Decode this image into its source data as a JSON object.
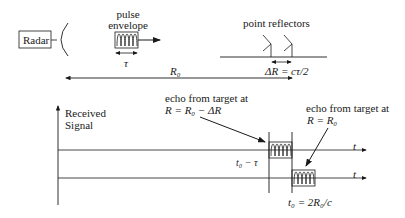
{
  "radar": {
    "label": "Radar"
  },
  "pulse": {
    "title_line1": "pulse",
    "title_line2": "envelope",
    "width_label": "τ"
  },
  "reflectors": {
    "title": "point reflectors",
    "spacing_label": "ΔR = cτ/2"
  },
  "range": {
    "label": "R₀"
  },
  "axis": {
    "y_label_line1": "Received",
    "y_label_line2": "Signal",
    "time_label_1": "t",
    "time_label_2": "t"
  },
  "echo_near": {
    "line1": "echo from target at",
    "line2": "R = R₀ − ΔR",
    "time_label": "t₀ − τ"
  },
  "echo_far": {
    "line1": "echo from target at",
    "line2": "R = R₀",
    "time_label": "t₀ = 2R₀/c"
  }
}
